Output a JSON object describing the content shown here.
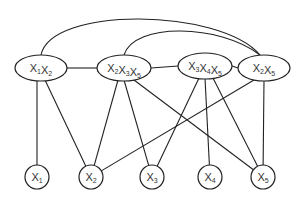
{
  "diagram": {
    "type": "bipartite junction graph",
    "clusters": [
      {
        "id": "c1",
        "vars": [
          "1",
          "2"
        ],
        "cx": 41,
        "cy": 68,
        "rx": 26,
        "ry": 13
      },
      {
        "id": "c2",
        "vars": [
          "2",
          "3",
          "5"
        ],
        "cx": 124,
        "cy": 68,
        "rx": 27,
        "ry": 13
      },
      {
        "id": "c3",
        "vars": [
          "3",
          "4",
          "5"
        ],
        "cx": 205,
        "cy": 66,
        "rx": 27,
        "ry": 13
      },
      {
        "id": "c4",
        "vars": [
          "2",
          "5"
        ],
        "cx": 264,
        "cy": 68,
        "rx": 26,
        "ry": 13
      }
    ],
    "variables": [
      {
        "id": "v1",
        "var": "1",
        "cx": 37,
        "cy": 177,
        "r": 12
      },
      {
        "id": "v2",
        "var": "2",
        "cx": 91,
        "cy": 177,
        "r": 12
      },
      {
        "id": "v3",
        "var": "3",
        "cx": 152,
        "cy": 177,
        "r": 12
      },
      {
        "id": "v4",
        "var": "4",
        "cx": 210,
        "cy": 177,
        "r": 12
      },
      {
        "id": "v5",
        "var": "5",
        "cx": 263,
        "cy": 177,
        "r": 12
      }
    ],
    "edges": [
      [
        "c1",
        "c2"
      ],
      [
        "c2",
        "c3"
      ],
      [
        "c3",
        "c4"
      ],
      [
        "c1",
        "v1"
      ],
      [
        "c1",
        "v2"
      ],
      [
        "c2",
        "v2"
      ],
      [
        "c2",
        "v3"
      ],
      [
        "c2",
        "v5"
      ],
      [
        "c3",
        "v3"
      ],
      [
        "c3",
        "v4"
      ],
      [
        "c3",
        "v5"
      ],
      [
        "c4",
        "v2"
      ],
      [
        "c4",
        "v5"
      ]
    ],
    "arcs": [
      [
        "c1",
        "c4"
      ],
      [
        "c2",
        "c4"
      ]
    ],
    "label_prefix": "X"
  }
}
